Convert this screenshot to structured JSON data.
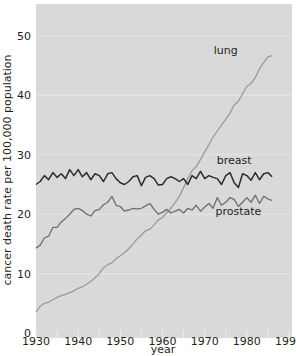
{
  "chart_data": {
    "type": "line",
    "title": "",
    "xlabel": "year",
    "ylabel": "cancer death rate per 100,000 population",
    "xlim": [
      1930,
      1990
    ],
    "ylim": [
      0,
      55
    ],
    "x_ticks": [
      1930,
      1940,
      1950,
      1960,
      1970,
      1980,
      1990
    ],
    "y_ticks": [
      0,
      10,
      20,
      30,
      40,
      50
    ],
    "grid": true,
    "legend": "inline labels",
    "colors": {
      "background": "#d9d9d9",
      "lung": "#9a9a9a",
      "breast": "#2b2b2b",
      "prostate": "#6e6e6e",
      "grid": "#eeeeee"
    },
    "series": [
      {
        "name": "lung",
        "label_pos": [
          1975,
          47
        ],
        "x": [
          1930,
          1931,
          1932,
          1933,
          1934,
          1935,
          1936,
          1937,
          1938,
          1939,
          1940,
          1941,
          1942,
          1943,
          1944,
          1945,
          1946,
          1947,
          1948,
          1949,
          1950,
          1951,
          1952,
          1953,
          1954,
          1955,
          1956,
          1957,
          1958,
          1959,
          1960,
          1961,
          1962,
          1963,
          1964,
          1965,
          1966,
          1967,
          1968,
          1969,
          1970,
          1971,
          1972,
          1973,
          1974,
          1975,
          1976,
          1977,
          1978,
          1979,
          1980,
          1981,
          1982,
          1983,
          1984,
          1985,
          1986
        ],
        "values": [
          3.5,
          4.5,
          5.0,
          5.2,
          5.6,
          6.0,
          6.3,
          6.5,
          6.8,
          7.1,
          7.5,
          7.8,
          8.2,
          8.7,
          9.3,
          10.0,
          11.0,
          11.5,
          11.8,
          12.5,
          13.0,
          13.5,
          14.2,
          15.0,
          15.8,
          16.5,
          17.2,
          17.5,
          18.2,
          19.0,
          19.5,
          20.2,
          21.0,
          22.0,
          23.0,
          24.5,
          26.0,
          27.3,
          28.0,
          29.2,
          30.5,
          31.7,
          33.0,
          34.0,
          35.0,
          36.0,
          37.0,
          38.4,
          39.0,
          40.3,
          41.5,
          42.0,
          43.0,
          44.5,
          45.5,
          46.5,
          46.7
        ]
      },
      {
        "name": "breast",
        "label_pos": [
          1977,
          28.5
        ],
        "x": [
          1930,
          1931,
          1932,
          1933,
          1934,
          1935,
          1936,
          1937,
          1938,
          1939,
          1940,
          1941,
          1942,
          1943,
          1944,
          1945,
          1946,
          1947,
          1948,
          1949,
          1950,
          1951,
          1952,
          1953,
          1954,
          1955,
          1956,
          1957,
          1958,
          1959,
          1960,
          1961,
          1962,
          1963,
          1964,
          1965,
          1966,
          1967,
          1968,
          1969,
          1970,
          1971,
          1972,
          1973,
          1974,
          1975,
          1976,
          1977,
          1978,
          1979,
          1980,
          1981,
          1982,
          1983,
          1984,
          1985,
          1986
        ],
        "values": [
          25.0,
          25.5,
          26.5,
          25.8,
          27.0,
          26.2,
          26.8,
          26.0,
          27.5,
          26.5,
          27.5,
          26.3,
          27.0,
          25.8,
          26.8,
          26.5,
          25.5,
          26.8,
          27.0,
          26.0,
          25.3,
          25.0,
          25.5,
          26.3,
          26.5,
          24.8,
          26.2,
          26.5,
          26.0,
          24.9,
          25.0,
          26.0,
          26.3,
          26.0,
          25.5,
          26.0,
          25.0,
          26.5,
          26.0,
          27.2,
          26.0,
          26.5,
          26.2,
          26.0,
          25.0,
          26.5,
          27.0,
          25.3,
          24.5,
          26.8,
          26.5,
          25.7,
          27.0,
          25.8,
          26.8,
          27.0,
          26.3
        ]
      },
      {
        "name": "prostate",
        "label_pos": [
          1978,
          19.8
        ],
        "x": [
          1930,
          1931,
          1932,
          1933,
          1934,
          1935,
          1936,
          1937,
          1938,
          1939,
          1940,
          1941,
          1942,
          1943,
          1944,
          1945,
          1946,
          1947,
          1948,
          1949,
          1950,
          1951,
          1952,
          1953,
          1954,
          1955,
          1956,
          1957,
          1958,
          1959,
          1960,
          1961,
          1962,
          1963,
          1964,
          1965,
          1966,
          1967,
          1968,
          1969,
          1970,
          1971,
          1972,
          1973,
          1974,
          1975,
          1976,
          1977,
          1978,
          1979,
          1980,
          1981,
          1982,
          1983,
          1984,
          1985,
          1986
        ],
        "values": [
          14.3,
          14.8,
          16.0,
          16.3,
          17.8,
          17.8,
          18.7,
          19.3,
          20.0,
          20.8,
          21.0,
          20.6,
          20.0,
          19.7,
          20.6,
          20.8,
          21.6,
          22.0,
          23.0,
          21.5,
          21.3,
          20.5,
          20.7,
          21.0,
          20.9,
          21.0,
          21.4,
          21.8,
          20.8,
          20.0,
          20.3,
          20.8,
          20.2,
          20.5,
          20.8,
          20.2,
          21.0,
          20.7,
          21.5,
          20.5,
          21.2,
          21.8,
          21.0,
          22.8,
          21.5,
          22.0,
          22.8,
          22.5,
          21.3,
          22.0,
          22.8,
          22.0,
          23.2,
          21.8,
          23.0,
          22.6,
          22.3
        ]
      }
    ]
  }
}
